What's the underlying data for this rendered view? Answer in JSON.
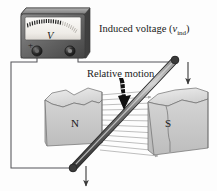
{
  "figure": {
    "background_color": "#fdfdfd"
  },
  "labels": {
    "induced_voltage_prefix": "Induced voltage (",
    "induced_voltage_symbol": "v",
    "induced_voltage_subscript": "ind",
    "induced_voltage_suffix": ")",
    "relative_motion": "Relative motion",
    "pole_north": "N",
    "pole_south": "S",
    "meter_unit": "V",
    "terminal_positive": "+",
    "terminal_negative": "–"
  },
  "meter": {
    "name": "analog voltmeter",
    "body_color": "#6d6d6d",
    "face_color": "#f2f0ec",
    "tick_color": "#1c1c1c",
    "tick_count": 23,
    "terminal_color": "#2b2b2b"
  },
  "magnets": {
    "north": {
      "label": "N",
      "face_color": "#c9c9c9",
      "top_color": "#e2e2e2",
      "side_color": "#b0b0b0"
    },
    "south": {
      "label": "S",
      "face_color": "#c9c9c9",
      "top_color": "#e2e2e2",
      "side_color": "#b0b0b0"
    }
  },
  "field": {
    "name": "magnetic field lines",
    "direction": "north to south",
    "color": "#a8a8a8",
    "line_count": 12
  },
  "conductor": {
    "name": "conducting rod",
    "color_dark": "#4a4a4a",
    "color_light": "#9a9a9a",
    "orientation": "lower-left to upper-right diagonal"
  },
  "motion_arrow": {
    "name": "relative motion arrow",
    "direction": "down",
    "color": "#111111"
  },
  "rod_arrows": {
    "direction": "down",
    "color": "#3a3a3a",
    "count": 2
  },
  "circuit": {
    "wire_color": "#55555a",
    "description": "wire loop from voltmeter terminals to rod ends"
  }
}
